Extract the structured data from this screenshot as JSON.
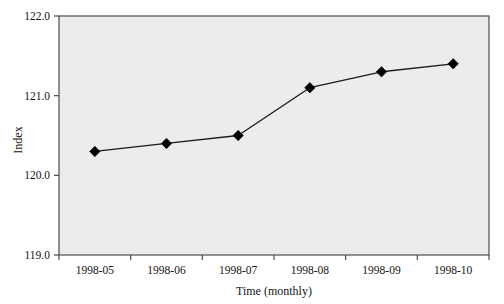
{
  "chart_data": {
    "type": "line",
    "title": "",
    "subtitle": "",
    "xlabel": "Time (monthly)",
    "ylabel": "Index",
    "categories": [
      "1998-05",
      "1998-06",
      "1998-07",
      "1998-08",
      "1998-09",
      "1998-10"
    ],
    "values": [
      120.3,
      120.4,
      120.5,
      121.1,
      121.3,
      121.4
    ],
    "series": [
      {
        "name": "Index",
        "values": [
          120.3,
          120.4,
          120.5,
          121.1,
          121.3,
          121.4
        ]
      }
    ],
    "ylim": [
      119.0,
      122.0
    ],
    "ytick_labels": [
      "119.0",
      "120.0",
      "121.0",
      "122.0"
    ],
    "ytick_values": [
      119.0,
      120.0,
      121.0,
      122.0
    ],
    "xtick_labels": [
      "1998-05",
      "1998-06",
      "1998-07",
      "1998-08",
      "1998-09",
      "1998-10"
    ],
    "grid": false,
    "legend": false,
    "legend_position": "none",
    "marker": "diamond",
    "line_color": "#1a1a1a",
    "marker_color": "#000000",
    "plot_background_color": "#ececec",
    "page_background_color": "#ffffff",
    "frame_color": "#4d4d4d",
    "annotations": []
  }
}
